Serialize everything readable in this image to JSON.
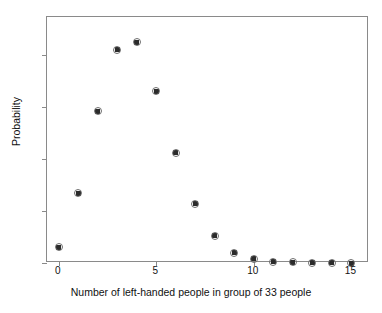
{
  "chart_data": {
    "type": "scatter",
    "title": "",
    "xlabel": "Number of left-handed people in group of 33 people",
    "ylabel": "Probability",
    "x": [
      0,
      1,
      2,
      3,
      4,
      5,
      6,
      7,
      8,
      9,
      10,
      11,
      12,
      13,
      14,
      15
    ],
    "values": [
      0.015,
      0.067,
      0.146,
      0.205,
      0.212,
      0.165,
      0.106,
      0.057,
      0.026,
      0.01,
      0.004,
      0.001,
      0.0005,
      0.0002,
      0.0001,
      0.0
    ],
    "categories": [
      "0",
      "1",
      "2",
      "3",
      "4",
      "5",
      "6",
      "7",
      "8",
      "9",
      "10",
      "11",
      "12",
      "13",
      "14",
      "15"
    ],
    "xlim": [
      -0.6,
      15.9
    ],
    "ylim": [
      0,
      0.2365
    ],
    "xticks": [
      0,
      5,
      10,
      15
    ],
    "xtick_labels": [
      "0",
      "5",
      "10",
      "15"
    ],
    "yticks": [
      0,
      0.05,
      0.1,
      0.15,
      0.2
    ],
    "ytick_labels": [
      "0",
      ".05",
      ".1",
      ".15",
      ".2"
    ],
    "grid": false,
    "legend": null,
    "marker": "square-with-circle",
    "marker_color": "#2b2b2b",
    "frame_color": "#8a8a8a",
    "background": "#ffffff"
  }
}
